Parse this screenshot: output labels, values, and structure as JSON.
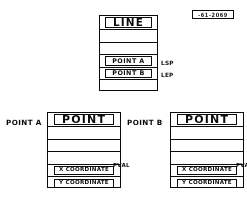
{
  "diagram": {
    "line_record": {
      "name": "LINE",
      "rows": [
        {
          "label": "LINE",
          "kind": "title"
        },
        {
          "label": "",
          "kind": "blank"
        },
        {
          "label": "",
          "kind": "blank"
        },
        {
          "label": "POINT A",
          "kind": "field",
          "note": "LSP"
        },
        {
          "label": "POINT B",
          "kind": "field",
          "note": "LEP"
        },
        {
          "label": "",
          "kind": "blank"
        }
      ],
      "notes": {
        "start_point": "LSP",
        "end_point": "LEP"
      }
    },
    "point_a_record": {
      "outside_label": "POINT A",
      "name": "POINT",
      "rows": [
        {
          "label": "POINT",
          "kind": "title"
        },
        {
          "label": "",
          "kind": "blank"
        },
        {
          "label": "",
          "kind": "blank"
        },
        {
          "label": "",
          "kind": "blank"
        },
        {
          "label": "X COORDINATE",
          "kind": "field",
          "note": "PVAL"
        },
        {
          "label": "Y COORDINATE",
          "kind": "field"
        }
      ],
      "notes": {
        "value": "PVAL"
      }
    },
    "point_b_record": {
      "outside_label": "POINT B",
      "name": "POINT",
      "rows": [
        {
          "label": "POINT",
          "kind": "title"
        },
        {
          "label": "",
          "kind": "blank"
        },
        {
          "label": "",
          "kind": "blank"
        },
        {
          "label": "",
          "kind": "blank"
        },
        {
          "label": "X COORDINATE",
          "kind": "field",
          "note": "PVAL"
        },
        {
          "label": "Y COORDINATE",
          "kind": "field"
        }
      ],
      "notes": {
        "value": "PVAL"
      }
    },
    "corner_stamp": {
      "text": "-61-2069"
    },
    "colors": {
      "ink": "#111111",
      "paper": "#ffffff"
    }
  }
}
